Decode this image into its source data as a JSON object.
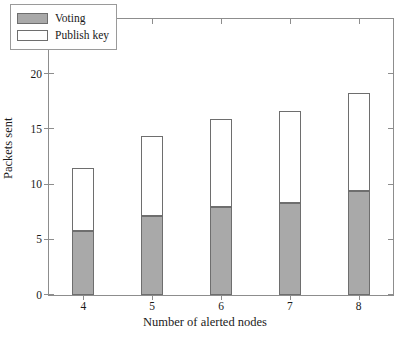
{
  "chart_data": {
    "type": "bar",
    "subtype": "stacked",
    "title": "",
    "xlabel": "Number of alerted nodes",
    "ylabel": "Packets sent",
    "categories": [
      "4",
      "5",
      "6",
      "7",
      "8"
    ],
    "series": [
      {
        "name": "Voting",
        "values": [
          5.8,
          7.2,
          8.0,
          8.3,
          9.4
        ],
        "color": "#a9a9a9"
      },
      {
        "name": "Publish key",
        "values": [
          5.7,
          7.2,
          7.9,
          8.4,
          8.9
        ],
        "color": "#ffffff"
      }
    ],
    "totals": [
      11.5,
      14.4,
      15.9,
      16.7,
      18.3
    ],
    "ylim": [
      0,
      25
    ],
    "yticks": [
      0,
      5,
      10,
      15,
      20,
      25
    ],
    "ytick_labels": [
      "0",
      "5",
      "10",
      "15",
      "20",
      "25"
    ],
    "xtick_labels": [
      "4",
      "5",
      "6",
      "7",
      "8"
    ],
    "grid": false,
    "legend_position": "upper left"
  },
  "legend": {
    "items": [
      {
        "label": "Voting",
        "swatch": "voting"
      },
      {
        "label": "Publish key",
        "swatch": "publish"
      }
    ]
  },
  "axes": {
    "x_title": "Number of alerted nodes",
    "y_title": "Packets sent"
  }
}
